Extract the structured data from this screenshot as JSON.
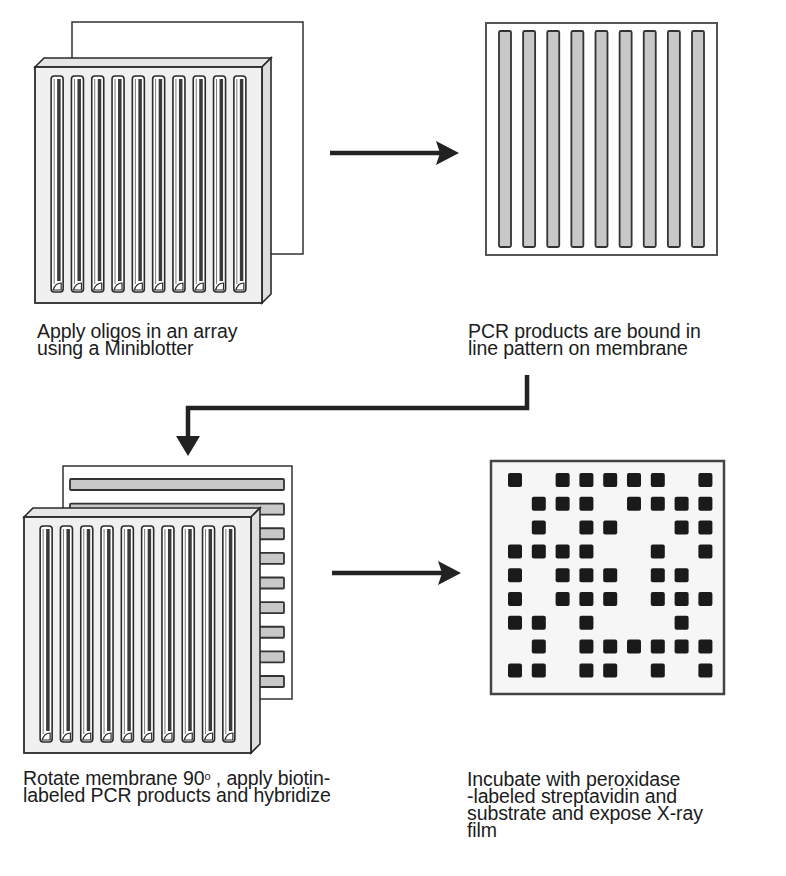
{
  "steps": [
    {
      "id": 1,
      "illustration": "miniblotter-over-membrane",
      "caption_lines": [
        "Apply oligos in an array",
        "using a Miniblotter"
      ]
    },
    {
      "id": 2,
      "illustration": "membrane-with-vertical-lines",
      "caption_lines": [
        "PCR products are bound in",
        "line pattern on membrane"
      ]
    },
    {
      "id": 3,
      "illustration": "miniblotter-over-rotated-membrane",
      "caption_lines": [
        "Rotate membrane 90",
        " , apply biotin-",
        "labeled PCR products and hybridize"
      ],
      "caption_superscript": "o"
    },
    {
      "id": 4,
      "illustration": "dot-blot-result",
      "caption_lines": [
        "Incubate with peroxidase",
        "-labeled streptavidin and",
        "substrate and expose X-ray",
        "film"
      ]
    }
  ],
  "arrows": [
    {
      "from": 1,
      "to": 2,
      "type": "right-arrow"
    },
    {
      "from": 2,
      "to": 3,
      "type": "elbow-down-left-arrow"
    },
    {
      "from": 3,
      "to": 4,
      "type": "right-arrow"
    }
  ],
  "miniblotter": {
    "slot_count": 10
  },
  "membrane": {
    "line_count": 9
  },
  "rotated_membrane": {
    "line_count": 9
  },
  "dot_blot": {
    "rows": 9,
    "cols": 9,
    "grid": [
      [
        1,
        0,
        1,
        1,
        1,
        1,
        1,
        0,
        1
      ],
      [
        0,
        1,
        1,
        1,
        0,
        1,
        1,
        1,
        1
      ],
      [
        0,
        1,
        0,
        1,
        1,
        0,
        0,
        1,
        1
      ],
      [
        1,
        1,
        1,
        1,
        0,
        0,
        1,
        0,
        1
      ],
      [
        1,
        0,
        1,
        1,
        1,
        0,
        1,
        1,
        0
      ],
      [
        1,
        0,
        1,
        1,
        1,
        0,
        1,
        1,
        1
      ],
      [
        1,
        1,
        0,
        1,
        0,
        0,
        0,
        1,
        0
      ],
      [
        0,
        1,
        0,
        1,
        1,
        1,
        1,
        1,
        1
      ],
      [
        1,
        1,
        0,
        1,
        1,
        0,
        1,
        0,
        1
      ]
    ]
  },
  "colors": {
    "stroke": "#2a2a2a",
    "line_fill": "#c8c8c8",
    "block_fill": "#f0f0f0",
    "membrane_fill": "#f7f7f7",
    "dot": "#1a1a1a"
  }
}
